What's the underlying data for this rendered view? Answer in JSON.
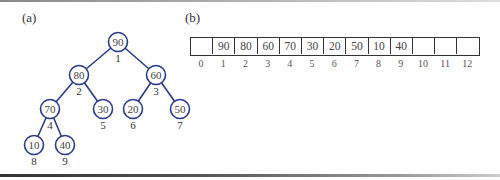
{
  "panels": {
    "a": {
      "label": "(a)"
    },
    "b": {
      "label": "(b)"
    }
  },
  "tree": {
    "node_color": "#2a3a8c",
    "nodes": [
      {
        "index": "1",
        "value": "90",
        "cx": 118,
        "cy": 42
      },
      {
        "index": "2",
        "value": "80",
        "cx": 79,
        "cy": 75
      },
      {
        "index": "3",
        "value": "60",
        "cx": 156,
        "cy": 75
      },
      {
        "index": "4",
        "value": "70",
        "cx": 50,
        "cy": 109
      },
      {
        "index": "5",
        "value": "30",
        "cx": 103,
        "cy": 109
      },
      {
        "index": "6",
        "value": "20",
        "cx": 133,
        "cy": 109
      },
      {
        "index": "7",
        "value": "50",
        "cx": 180,
        "cy": 109
      },
      {
        "index": "8",
        "value": "10",
        "cx": 34,
        "cy": 145
      },
      {
        "index": "9",
        "value": "40",
        "cx": 65,
        "cy": 145
      }
    ],
    "edges": [
      [
        0,
        1
      ],
      [
        0,
        2
      ],
      [
        1,
        3
      ],
      [
        1,
        4
      ],
      [
        2,
        5
      ],
      [
        2,
        6
      ],
      [
        3,
        7
      ],
      [
        3,
        8
      ]
    ]
  },
  "array": {
    "cells": [
      "",
      "90",
      "80",
      "60",
      "70",
      "30",
      "20",
      "50",
      "10",
      "40",
      "",
      "",
      ""
    ],
    "indices": [
      "0",
      "1",
      "2",
      "3",
      "4",
      "5",
      "6",
      "7",
      "8",
      "9",
      "10",
      "11",
      "12"
    ]
  }
}
